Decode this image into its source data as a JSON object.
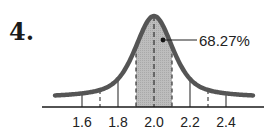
{
  "problem_number": "4.",
  "chart_data": {
    "type": "area",
    "title": "",
    "xlabel": "",
    "ylabel": "",
    "distribution": "normal",
    "mean": 2.0,
    "std_dev": 0.1,
    "x_tick_labels": [
      "1.6",
      "1.8",
      "2.0",
      "2.2",
      "2.4"
    ],
    "x_ticks": [
      1.6,
      1.7,
      1.8,
      1.9,
      2.0,
      2.1,
      2.2,
      2.3,
      2.4
    ],
    "xlim": [
      1.45,
      2.55
    ],
    "shaded_region": [
      1.9,
      2.1
    ],
    "annotation": "68.27%",
    "grid": false,
    "legend": null
  }
}
